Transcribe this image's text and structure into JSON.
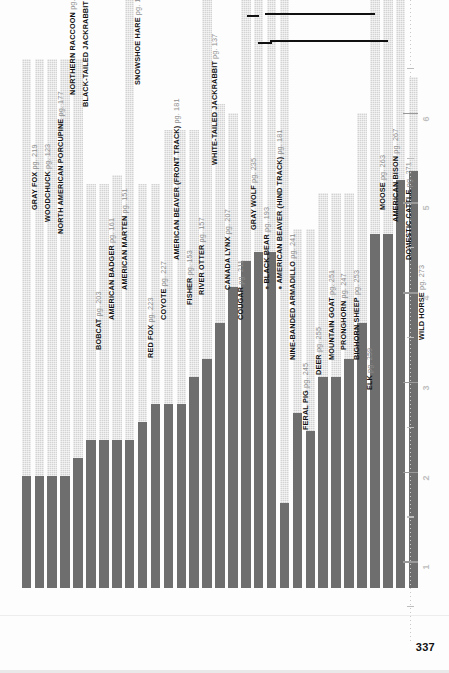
{
  "page": {
    "folio": "337",
    "background": "#fdfdfd",
    "bar_light_color": "#d3d3d3",
    "bar_dark_color": "#6e6e6e"
  },
  "ruler": {
    "label_unit": "inches",
    "ticks": [
      "1",
      "2",
      "3",
      "4",
      "5",
      "6"
    ]
  },
  "chart_data": {
    "type": "bar",
    "title": "",
    "xlabel": "",
    "ylabel": "",
    "ylim": [
      0,
      7
    ],
    "grid": false,
    "legend": "none",
    "orientation": "vertical",
    "note": "Each entry has a total (light) value and a solid (dark) sub-value.",
    "categories": [
      "GRAY FOX",
      "WOODCHUCK",
      "NORTH AMERICAN PORCUPINE",
      "NORTHERN RACCOON",
      "BLACK-TAILED JACKRABBIT",
      "BOBCAT",
      "AMERICAN BADGER",
      "AMERICAN MARTEN",
      "SNOWSHOE HARE",
      "RED FOX",
      "COYOTE",
      "AMERICAN BEAVER (FRONT TRACK)",
      "FISHER",
      "RIVER OTTER",
      "WHITE-TAILED JACKRABBIT",
      "CANADA LYNX",
      "COUGAR",
      "GRAY WOLF",
      "BLACK BEAR",
      "AMERICAN BEAVER (HIND TRACK)",
      "NINE-BANDED ARMADILLO",
      "FERAL PIG",
      "DEER",
      "MOUNTAIN GOAT",
      "PRONGHORN",
      "BIGHORN SHEEP",
      "ELK",
      "MOOSE",
      "AMERICAN BISON",
      "DOMESTIC CATTLE",
      "WILD HORSE"
    ],
    "pages": [
      "pg. 219",
      "pg. 123",
      "pg. 177",
      "pg. 189",
      "pg. 137",
      "pg. 203",
      "pg. 161",
      "pg. 151",
      "pg. 133",
      "pg. 223",
      "pg. 227",
      "pg. 181",
      "pg. 153",
      "pg. 157",
      "pg. 137",
      "pg. 207",
      "pg. 211",
      "pg. 235",
      "pg. 193",
      "pg. 181",
      "pg. 241",
      "pg. 245",
      "pg. 255",
      "pg. 251",
      "pg. 247",
      "pg. 253",
      "pg. 259",
      "pg. 263",
      "pg. 267",
      "pg. 271",
      "pg. 273"
    ],
    "series": [
      {
        "name": "total length (light bar)",
        "values": [
          5.9,
          5.9,
          5.9,
          5.9,
          5.9,
          4.5,
          4.5,
          4.6,
          6.6,
          4.5,
          4.5,
          5.1,
          5.1,
          5.1,
          7.0,
          5.4,
          5.3,
          7.0,
          7.0,
          7.0,
          7.0,
          4.0,
          4.0,
          4.4,
          4.4,
          4.4,
          5.3,
          7.0,
          7.0,
          7.0,
          5.7
        ]
      },
      {
        "name": "track width (dark bar)",
        "values": [
          1.25,
          1.25,
          1.25,
          1.25,
          1.45,
          1.65,
          1.65,
          1.65,
          1.65,
          1.85,
          2.05,
          2.05,
          2.05,
          2.35,
          2.55,
          2.95,
          3.35,
          3.65,
          3.75,
          3.75,
          0.95,
          1.95,
          1.75,
          2.35,
          2.35,
          2.55,
          2.95,
          3.95,
          3.95,
          4.55,
          4.65
        ]
      }
    ]
  },
  "labels": [
    {
      "text": "GRAY FOX",
      "pg": "pg. 219",
      "bullet": false
    },
    {
      "text": "WOODCHUCK",
      "pg": "pg. 123",
      "bullet": false
    },
    {
      "text": "NORTH AMERICAN PORCUPINE",
      "pg": "pg. 177",
      "bullet": false
    },
    {
      "text": "NORTHERN RACCOON",
      "pg": "pg. 189",
      "bullet": false
    },
    {
      "text": "BLACK-TAILED JACKRABBIT",
      "pg": "pg. 137",
      "bullet": false
    },
    {
      "text": "BOBCAT",
      "pg": "pg. 203",
      "bullet": false
    },
    {
      "text": "AMERICAN BADGER",
      "pg": "pg. 161",
      "bullet": false
    },
    {
      "text": "AMERICAN MARTEN",
      "pg": "pg. 151",
      "bullet": false
    },
    {
      "text": "SNOWSHOE HARE",
      "pg": "pg. 133",
      "bullet": false
    },
    {
      "text": "RED FOX",
      "pg": "pg. 223",
      "bullet": false
    },
    {
      "text": "COYOTE",
      "pg": "pg. 227",
      "bullet": false
    },
    {
      "text": "AMERICAN BEAVER (FRONT TRACK)",
      "pg": "pg. 181",
      "bullet": false
    },
    {
      "text": "FISHER",
      "pg": "pg. 153",
      "bullet": false
    },
    {
      "text": "RIVER OTTER",
      "pg": "pg. 157",
      "bullet": false
    },
    {
      "text": "WHITE-TAILED JACKRABBIT",
      "pg": "pg. 137",
      "bullet": false
    },
    {
      "text": "CANADA LYNX",
      "pg": "pg. 207",
      "bullet": false
    },
    {
      "text": "COUGAR",
      "pg": "pg. 211",
      "bullet": false
    },
    {
      "text": "GRAY WOLF",
      "pg": "pg. 235",
      "bullet": false
    },
    {
      "text": "BLACK BEAR",
      "pg": "pg. 193",
      "bullet": true
    },
    {
      "text": "AMERICAN BEAVER (HIND TRACK)",
      "pg": "pg. 181",
      "bullet": true
    },
    {
      "text": "NINE-BANDED ARMADILLO",
      "pg": "pg. 241",
      "bullet": false
    },
    {
      "text": "FERAL PIG",
      "pg": "pg. 245",
      "bullet": false
    },
    {
      "text": "DEER",
      "pg": "pg. 255",
      "bullet": false
    },
    {
      "text": "MOUNTAIN GOAT",
      "pg": "pg. 251",
      "bullet": false
    },
    {
      "text": "PRONGHORN",
      "pg": "pg. 247",
      "bullet": false
    },
    {
      "text": "BIGHORN SHEEP",
      "pg": "pg. 253",
      "bullet": false
    },
    {
      "text": "ELK",
      "pg": "pg. 259",
      "bullet": false
    },
    {
      "text": "MOOSE",
      "pg": "pg. 263",
      "bullet": false
    },
    {
      "text": "AMERICAN BISON",
      "pg": "pg. 267",
      "bullet": false
    },
    {
      "text": "DOMESTIC CATTLE",
      "pg": "pg. 271",
      "bullet": false
    },
    {
      "text": "WILD HORSE",
      "pg": "pg. 273",
      "bullet": false
    }
  ]
}
